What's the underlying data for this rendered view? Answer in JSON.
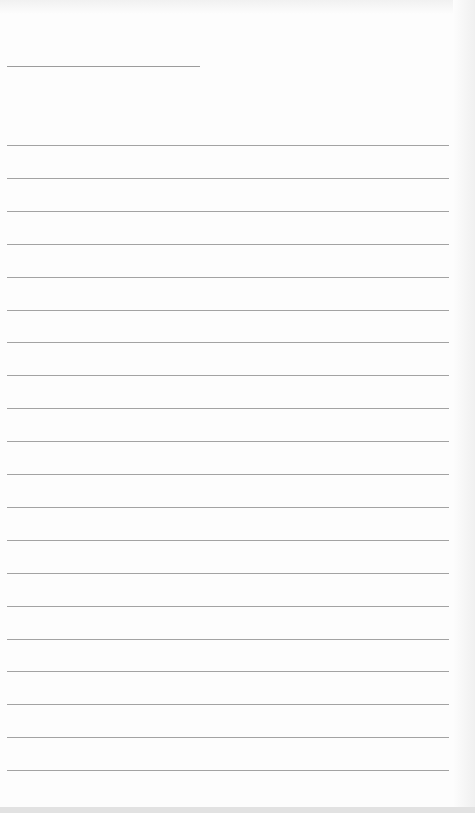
{
  "document": {
    "type": "ruled-sheet",
    "title_line": {
      "text": "",
      "x": 7,
      "y": 66,
      "width": 193
    },
    "rules": {
      "count": 20,
      "first_y": 145,
      "spacing": 32.9,
      "x": 7,
      "width": 442,
      "lines": [
        "",
        "",
        "",
        "",
        "",
        "",
        "",
        "",
        "",
        "",
        "",
        "",
        "",
        "",
        "",
        "",
        "",
        "",
        "",
        ""
      ]
    },
    "colors": {
      "paper": "#fdfdfd",
      "rule": "#a3a3a3",
      "bottom_band": "#e2e2e2"
    }
  }
}
